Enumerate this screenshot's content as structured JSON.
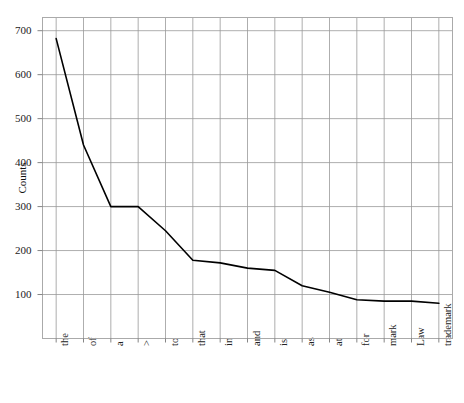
{
  "chart_data": {
    "type": "line",
    "title": "",
    "subtitle": "",
    "xlabel": "",
    "ylabel": "Counts",
    "categories": [
      "the",
      "of",
      "a",
      ">",
      "to",
      "that",
      "in",
      "and",
      "is",
      "as",
      "at",
      "for",
      "mark",
      "Law",
      "trademark"
    ],
    "values": [
      682,
      440,
      300,
      300,
      245,
      178,
      172,
      160,
      155,
      120,
      105,
      88,
      85,
      85,
      80
    ],
    "series": [
      {
        "name": "Counts",
        "values": [
          682,
          440,
          300,
          300,
          245,
          178,
          172,
          160,
          155,
          120,
          105,
          88,
          85,
          85,
          80
        ]
      }
    ],
    "ylim": [
      0,
      730
    ],
    "yticks": [
      100,
      200,
      300,
      400,
      500,
      600,
      700
    ],
    "ytick_labels": [
      "100",
      "200",
      "300",
      "400",
      "500",
      "600",
      "700"
    ],
    "grid": true,
    "grid_color": "#999999",
    "line_color": "#000000",
    "line_width": 1.6,
    "legend": false,
    "legend_position": "none",
    "frame_color": "#aaaaaa",
    "background_color": "#ffffff"
  },
  "figure": {
    "axis_label_y": "Counts"
  }
}
